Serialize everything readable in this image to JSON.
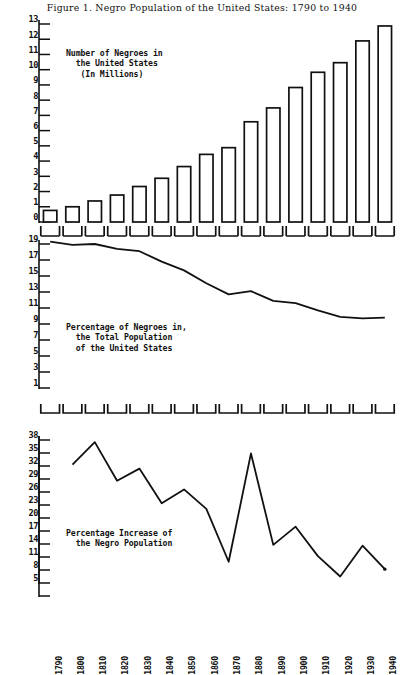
{
  "title": "Figure 1.   Negro Population of the United States: 1790 to 1940",
  "captions": {
    "bars": "Number of Negroes in\n  the United States\n   (In Millions)",
    "share": "Percentage of Negroes in,\n  the Total Population\n  of the United States",
    "increase": "Percentage Increase of\n  the Negro Population"
  },
  "axis": {
    "years": [
      "1790",
      "1800",
      "1810",
      "1820",
      "1830",
      "1840",
      "1850",
      "1860",
      "1870",
      "1880",
      "1890",
      "1900",
      "1910",
      "1920",
      "1930",
      "1940"
    ],
    "bars_ticks": [
      "13",
      "12",
      "11",
      "10",
      "9",
      "8",
      "7",
      "6",
      "5",
      "4",
      "3",
      "2",
      "1",
      "0"
    ],
    "share_ticks": [
      "19",
      "17",
      "15",
      "13",
      "11",
      "9",
      "7",
      "5",
      "3",
      "1"
    ],
    "increase_ticks": [
      "38",
      "35",
      "32",
      "29",
      "26",
      "23",
      "20",
      "17",
      "14",
      "11",
      "8",
      "5"
    ]
  },
  "chart_data": [
    {
      "type": "bar",
      "title": "Number of Negroes in the United States (In Millions)",
      "xlabel": "",
      "ylabel": "Millions",
      "ylim": [
        0,
        13
      ],
      "grid": false,
      "categories": [
        "1790",
        "1800",
        "1810",
        "1820",
        "1830",
        "1840",
        "1850",
        "1860",
        "1870",
        "1880",
        "1890",
        "1900",
        "1910",
        "1920",
        "1930",
        "1940"
      ],
      "values": [
        0.76,
        1.0,
        1.38,
        1.77,
        2.33,
        2.87,
        3.64,
        4.44,
        4.88,
        6.58,
        7.49,
        8.83,
        9.83,
        10.46,
        11.89,
        12.87
      ]
    },
    {
      "type": "line",
      "title": "Percentage of Negroes in the Total Population of the United States",
      "xlabel": "",
      "ylabel": "Percent",
      "ylim": [
        1,
        19
      ],
      "grid": false,
      "x": [
        "1790",
        "1800",
        "1810",
        "1820",
        "1830",
        "1840",
        "1850",
        "1860",
        "1870",
        "1880",
        "1890",
        "1900",
        "1910",
        "1920",
        "1930",
        "1940"
      ],
      "values": [
        19.3,
        18.9,
        19.0,
        18.4,
        18.1,
        16.8,
        15.7,
        14.1,
        12.7,
        13.1,
        11.9,
        11.6,
        10.7,
        9.9,
        9.7,
        9.8
      ]
    },
    {
      "type": "line",
      "title": "Percentage Increase of the Negro Population",
      "xlabel": "",
      "ylabel": "Percent increase",
      "ylim": [
        2,
        38
      ],
      "grid": false,
      "x": [
        "1800",
        "1810",
        "1820",
        "1830",
        "1840",
        "1850",
        "1860",
        "1870",
        "1880",
        "1890",
        "1900",
        "1910",
        "1920",
        "1930",
        "1940"
      ],
      "values": [
        32.3,
        37.5,
        28.6,
        31.4,
        23.4,
        26.6,
        22.1,
        9.9,
        34.9,
        13.8,
        18.0,
        11.2,
        6.5,
        13.6,
        8.2
      ]
    }
  ]
}
